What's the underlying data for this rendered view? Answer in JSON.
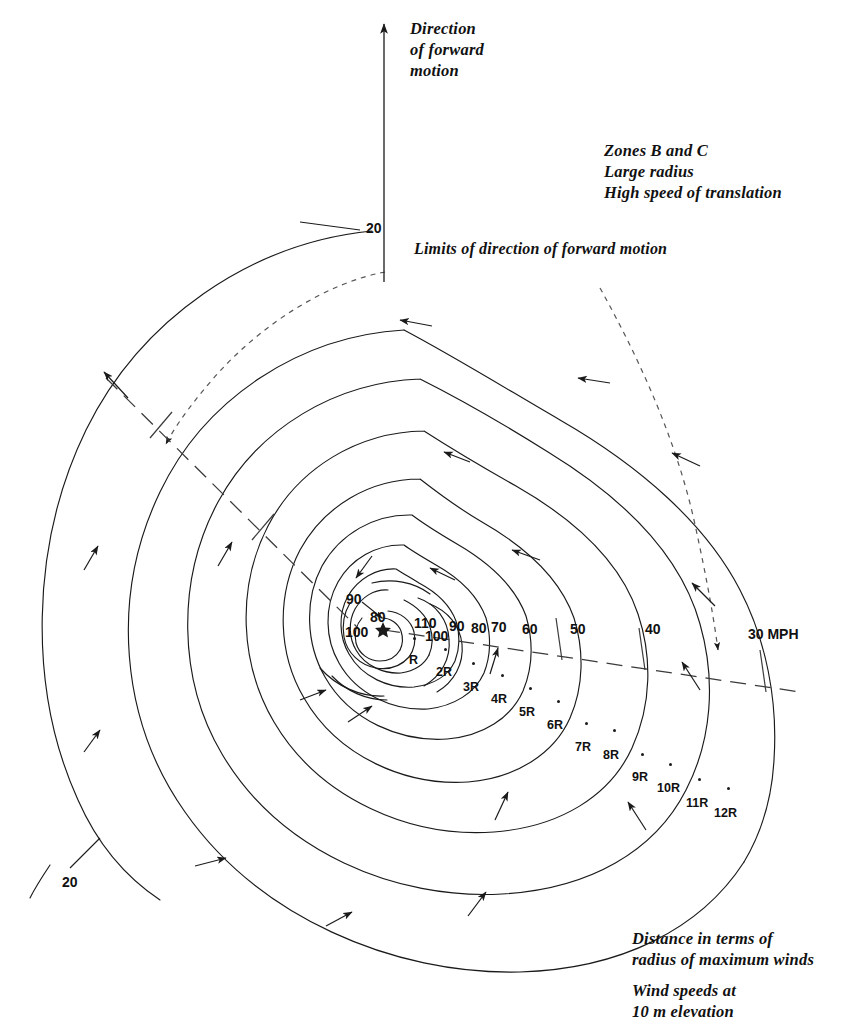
{
  "figure": {
    "kind": "hurricane-wind-field-diagram",
    "center_marker": "star",
    "units": "MPH",
    "line_color": "#1a1a1a",
    "background": "#ffffff"
  },
  "annotations": {
    "direction_of_motion": "Direction\nof forward\nmotion",
    "zone_block": "Zones B and C\nLarge radius\nHigh speed of translation",
    "limits_label": "Limits of direction of forward motion",
    "distance_caption": "Distance in terms of\nradius of maximum winds",
    "speed_caption": "Wind speeds at\n10 m elevation"
  },
  "chart_data": {
    "type": "contour",
    "xlabel": "Distance in terms of radius of maximum winds",
    "ylabel": "",
    "units": "MPH",
    "center": {
      "x": 383,
      "y": 629,
      "marker": "star"
    },
    "isotach_labels": [
      {
        "text": "90",
        "x": 346,
        "y": 599,
        "leader": true
      },
      {
        "text": "80",
        "x": 370,
        "y": 617
      },
      {
        "text": "100",
        "x": 345,
        "y": 632
      },
      {
        "text": "110",
        "x": 414,
        "y": 623
      },
      {
        "text": "100",
        "x": 425,
        "y": 636
      },
      {
        "text": "90",
        "x": 449,
        "y": 626
      },
      {
        "text": "80",
        "x": 471,
        "y": 628
      },
      {
        "text": "70",
        "x": 491,
        "y": 627
      },
      {
        "text": "60",
        "x": 522,
        "y": 629
      },
      {
        "text": "50",
        "x": 570,
        "y": 629
      },
      {
        "text": "40",
        "x": 645,
        "y": 629
      },
      {
        "text": "30 MPH",
        "x": 748,
        "y": 634
      },
      {
        "text": "20",
        "x": 366,
        "y": 228
      },
      {
        "text": "20",
        "x": 62,
        "y": 882
      }
    ],
    "isotach_values": [
      110,
      100,
      90,
      80,
      70,
      60,
      50,
      40,
      30,
      20
    ],
    "radius_markers": [
      {
        "label": "R",
        "dot_x": 413,
        "dot_y": 637,
        "lab_x": 409,
        "lab_y": 653
      },
      {
        "label": "2R",
        "dot_x": 444,
        "dot_y": 648,
        "lab_x": 436,
        "lab_y": 665
      },
      {
        "label": "3R",
        "dot_x": 472,
        "dot_y": 662,
        "lab_x": 463,
        "lab_y": 680
      },
      {
        "label": "4R",
        "dot_x": 501,
        "dot_y": 674,
        "lab_x": 491,
        "lab_y": 692
      },
      {
        "label": "5R",
        "dot_x": 529,
        "dot_y": 687,
        "lab_x": 519,
        "lab_y": 705
      },
      {
        "label": "6R",
        "dot_x": 557,
        "dot_y": 700,
        "lab_x": 547,
        "lab_y": 718
      },
      {
        "label": "7R",
        "dot_x": 585,
        "dot_y": 722,
        "lab_x": 575,
        "lab_y": 740
      },
      {
        "label": "8R",
        "dot_x": 613,
        "dot_y": 729,
        "lab_x": 603,
        "lab_y": 748
      },
      {
        "label": "9R",
        "dot_x": 641,
        "dot_y": 753,
        "lab_x": 632,
        "lab_y": 770
      },
      {
        "label": "10R",
        "dot_x": 669,
        "dot_y": 763,
        "lab_x": 657,
        "lab_y": 781
      },
      {
        "label": "11R",
        "dot_x": 698,
        "dot_y": 778,
        "lab_x": 686,
        "lab_y": 796
      },
      {
        "label": "12R",
        "dot_x": 727,
        "dot_y": 787,
        "lab_x": 714,
        "lab_y": 806
      }
    ],
    "flow_direction": "counterclockwise (cyclonic) with inward inflow component",
    "forward_motion_arrow": {
      "x": 384,
      "y_top": 22,
      "y_bottom": 280
    }
  }
}
